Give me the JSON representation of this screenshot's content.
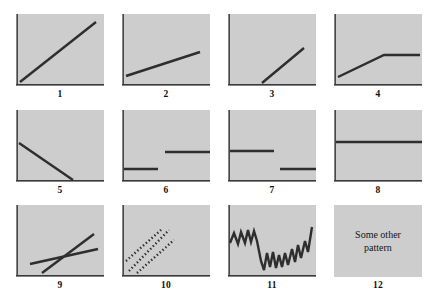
{
  "figure": {
    "title": "",
    "panel_fill": "#cdcdcd",
    "line_color": "#2e2e2e",
    "axis_color": "#3a3a3a",
    "background": "#ffffff",
    "columns": 4,
    "rows": 3
  },
  "panels": [
    {
      "number": "1",
      "pattern_name": "steep-rising-line",
      "text": "",
      "axes": {
        "left": true,
        "bottom": true
      },
      "lines": [
        {
          "style": "solid",
          "points": "4,68 80,8"
        }
      ]
    },
    {
      "number": "2",
      "pattern_name": "shallow-rising-line",
      "text": "",
      "axes": {
        "left": true,
        "bottom": true
      },
      "lines": [
        {
          "style": "solid",
          "points": "4,62 78,38"
        }
      ]
    },
    {
      "number": "3",
      "pattern_name": "delayed-rising-line",
      "text": "",
      "axes": {
        "left": true,
        "bottom": true
      },
      "lines": [
        {
          "style": "solid",
          "points": "34,69 76,34"
        }
      ]
    },
    {
      "number": "4",
      "pattern_name": "rising-then-plateau",
      "text": "",
      "axes": {
        "left": true,
        "bottom": true
      },
      "lines": [
        {
          "style": "solid",
          "points": "4,63 50,41 86,41"
        }
      ]
    },
    {
      "number": "5",
      "pattern_name": "falling-line",
      "text": "",
      "axes": {
        "left": true,
        "bottom": true
      },
      "lines": [
        {
          "style": "solid",
          "points": "3,33 57,70"
        }
      ]
    },
    {
      "number": "6",
      "pattern_name": "step-up",
      "text": "",
      "axes": {
        "left": true,
        "bottom": true
      },
      "lines": [
        {
          "style": "solid",
          "points": "2,59 36,59"
        },
        {
          "style": "solid",
          "points": "43,42 88,42"
        }
      ]
    },
    {
      "number": "7",
      "pattern_name": "step-down",
      "text": "",
      "axes": {
        "left": true,
        "bottom": true
      },
      "lines": [
        {
          "style": "solid",
          "points": "2,41 46,41"
        },
        {
          "style": "solid",
          "points": "52,59 88,59"
        }
      ]
    },
    {
      "number": "8",
      "pattern_name": "flat-line",
      "text": "",
      "axes": {
        "left": true,
        "bottom": true
      },
      "lines": [
        {
          "style": "solid",
          "points": "2,32 88,32"
        }
      ]
    },
    {
      "number": "9",
      "pattern_name": "crossing-lines",
      "text": "",
      "axes": {
        "left": true,
        "bottom": true
      },
      "lines": [
        {
          "style": "solid",
          "points": "14,59 82,44"
        },
        {
          "style": "solid",
          "points": "26,68 78,29"
        }
      ]
    },
    {
      "number": "10",
      "pattern_name": "three-parallel-dotted-lines",
      "text": "",
      "axes": {
        "left": true,
        "bottom": true
      },
      "lines": [
        {
          "style": "dotted",
          "points": "4,56 40,24"
        },
        {
          "style": "dotted",
          "points": "7,66 47,25"
        },
        {
          "style": "dotted",
          "points": "15,68 52,35"
        }
      ]
    },
    {
      "number": "11",
      "pattern_name": "volatile-zigzag",
      "text": "",
      "axes": {
        "left": true,
        "bottom": true
      },
      "lines": [
        {
          "style": "solid",
          "points": "2,38 6,28 10,39 13,27 17,38 20,25 23,37 26,26 29,36 33,56 36,65 39,48 42,62 45,47 48,63 51,50 54,62 57,48 60,60 64,44 67,57 70,40 73,53 77,36 80,47 84,22"
        }
      ]
    },
    {
      "number": "12",
      "pattern_name": "text-placeholder",
      "text": "Some other pattern",
      "axes": {
        "left": false,
        "bottom": false
      },
      "lines": []
    }
  ]
}
